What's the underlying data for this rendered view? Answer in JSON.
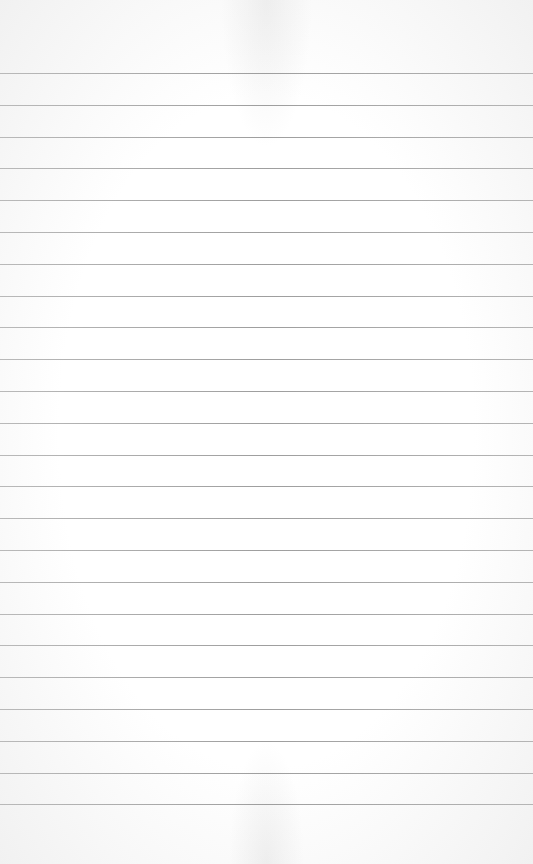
{
  "paper": {
    "type": "lined-paper",
    "background_color": "#ffffff",
    "rule_color": "#a8a8a8",
    "first_rule_y": 73,
    "rule_spacing": 31.8,
    "rule_count": 24
  }
}
